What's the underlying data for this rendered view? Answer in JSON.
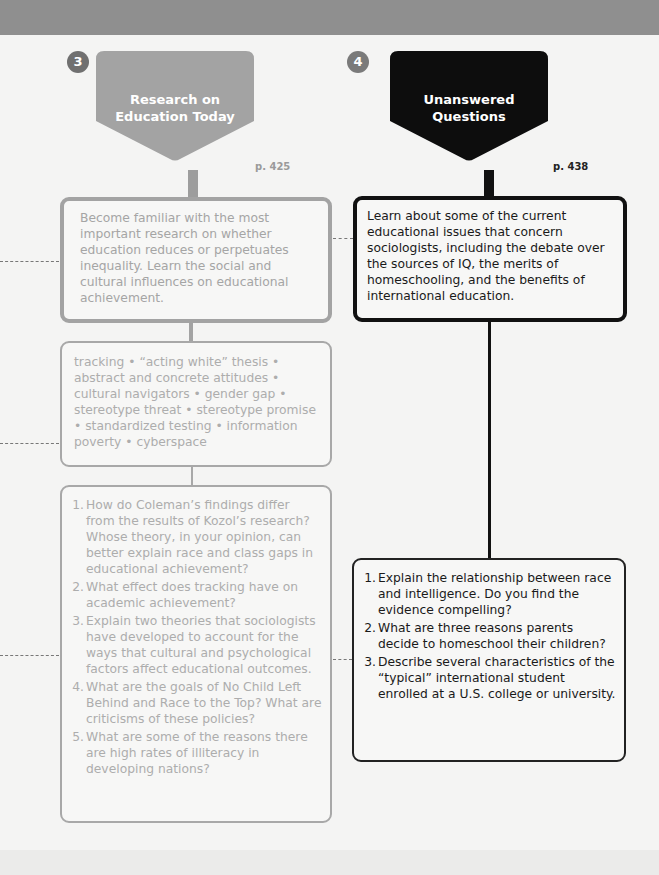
{
  "colors": {
    "section3_accent": "#a3a3a3",
    "section4_accent": "#111111",
    "header_band": "#8f8f8f",
    "background": "#f4f4f3"
  },
  "sections": [
    {
      "number": "3",
      "title_line1": "Research on",
      "title_line2": "Education Today",
      "page_ref": "p. 425",
      "goal": "Become familiar with the most important research on whether education reduces or perpetuates inequality. Learn the social and cultural influences on educational achievement.",
      "key_terms": "tracking • “acting white” thesis • abstract and concrete attitudes • cultural navigators • gender gap • stereotype threat • stereotype promise • standardized testing • information poverty • cyberspace",
      "questions": [
        {
          "num": "1.",
          "text": "How do Coleman’s findings differ from the results of Kozol’s research? Whose theory, in your opinion, can better explain race and class gaps in educational achievement?"
        },
        {
          "num": "2.",
          "text": "What effect does tracking have on academic achievement?"
        },
        {
          "num": "3.",
          "text": "Explain two theories that sociologists have developed to account for the ways that cultural and psychological factors affect educational outcomes."
        },
        {
          "num": "4.",
          "text": "What are the goals of No Child Left Behind and Race to the Top? What are criticisms of these policies?"
        },
        {
          "num": "5.",
          "text": "What are some of the reasons there are high rates of illiteracy in developing nations?"
        }
      ]
    },
    {
      "number": "4",
      "title_line1": "Unanswered",
      "title_line2": "Questions",
      "page_ref": "p. 438",
      "goal": "Learn about some of the current educational issues that concern sociologists, including the debate over the sources of IQ, the merits of homeschooling, and the benefits of international education.",
      "questions": [
        {
          "num": "1.",
          "text": "Explain the relationship between race and intelligence. Do you find the evidence compelling?"
        },
        {
          "num": "2.",
          "text": "What are three reasons parents decide to homeschool their children?"
        },
        {
          "num": "3.",
          "text": "Describe several characteristics of the “typical” international student enrolled at a U.S. college or university."
        }
      ]
    }
  ]
}
